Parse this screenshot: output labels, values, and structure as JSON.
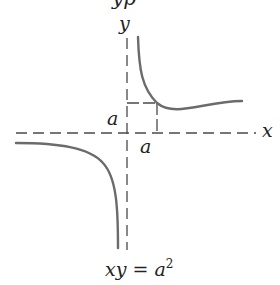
{
  "title_fragment": "yp",
  "axes": {
    "x_label": "x",
    "y_label": "y"
  },
  "markers": {
    "x_tick_label": "a",
    "y_tick_label": "a"
  },
  "equation": {
    "lhs": "xy = a",
    "exponent": "2"
  },
  "colors": {
    "curve": "#6b6b6b",
    "axis": "#4a4a4a",
    "text": "#222222"
  }
}
